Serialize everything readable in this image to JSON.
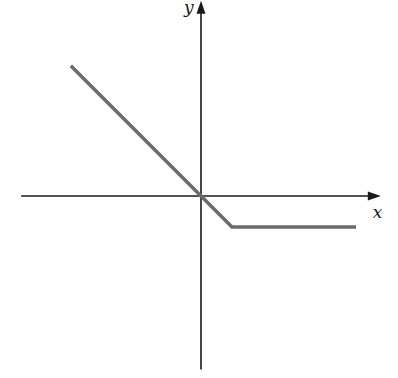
{
  "chart_data": {
    "type": "line",
    "title": "",
    "xlabel": "x",
    "ylabel": "y",
    "xlim": [
      -5.8,
      5.8
    ],
    "ylim": [
      -5.6,
      6.3
    ],
    "grid": false,
    "ticks": false,
    "legend": null,
    "series": [
      {
        "name": "piecewise",
        "color": "#6b6b6b",
        "description": "y = -x for x <= 1, y = -1 for x >= 1",
        "x": [
          -4.2,
          0,
          1,
          5
        ],
        "y": [
          4.2,
          0,
          -1,
          -1
        ]
      }
    ]
  }
}
